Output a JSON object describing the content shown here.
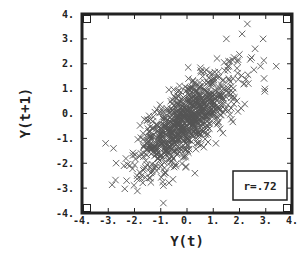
{
  "chart_data": {
    "type": "scatter",
    "title": "",
    "xlabel": "Y(t)",
    "ylabel": "Y(t+1)",
    "xlim": [
      -4,
      4
    ],
    "ylim": [
      -4,
      4
    ],
    "grid": false,
    "legend": null,
    "marker": "x",
    "marker_color": "#555555",
    "x_ticks": [
      -4,
      -3,
      -2,
      -1,
      0,
      1,
      2,
      3,
      4
    ],
    "x_tick_labels": [
      "-4.",
      "-3.",
      "-2.",
      "-1.",
      "0.",
      "1.",
      "2.",
      "3.",
      "4."
    ],
    "y_ticks": [
      -4,
      -3,
      -2,
      -1,
      0,
      1,
      2,
      3,
      4
    ],
    "y_tick_labels": [
      "-4.",
      "-3.",
      "-2.",
      "-1.",
      "0.",
      "1.",
      "2.",
      "3.",
      "4."
    ],
    "annotations": [
      {
        "text": "r=.72",
        "position": "bottom-right",
        "boxed": true
      }
    ],
    "correlation": 0.72,
    "read_from_image_outliers": {
      "note": "Individually distinguishable points read from the screenshot; values approximate (about +/-0.15 units).",
      "points": [
        [
          2.3,
          3.6
        ],
        [
          2.1,
          3.2
        ],
        [
          2.9,
          3.0
        ],
        [
          1.5,
          3.0
        ],
        [
          2.8,
          1.9
        ],
        [
          3.4,
          1.9
        ],
        [
          1.9,
          0.5
        ],
        [
          -3.1,
          -1.2
        ],
        [
          -2.8,
          -1.4
        ],
        [
          -2.4,
          -2.1
        ],
        [
          -2.3,
          -2.7
        ],
        [
          -1.9,
          -2.5
        ],
        [
          -0.9,
          -3.6
        ],
        [
          -0.9,
          -2.9
        ],
        [
          0.3,
          -2.4
        ],
        [
          1.1,
          -1.2
        ]
      ]
    },
    "synthetic_cloud": {
      "note": "The dense overlapping cloud cannot be read point-by-point from the pixels. It is rendered procedurally from these parameters and approximates the visual; it is not the figure's actual data.",
      "n_points": 900,
      "center": [
        0.0,
        -0.3
      ],
      "sd": [
        0.95,
        1.0
      ],
      "r": 0.72,
      "seed": 7
    }
  }
}
